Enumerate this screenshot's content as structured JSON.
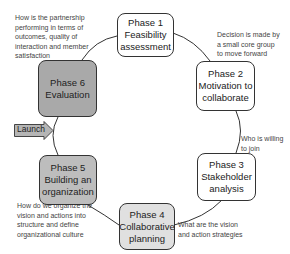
{
  "diagram": {
    "type": "cycle",
    "phases": [
      {
        "id": 1,
        "lines": [
          "Phase 1",
          "Feasibility",
          "assessment"
        ],
        "fill": "#ffffff"
      },
      {
        "id": 2,
        "lines": [
          "Phase 2",
          "Motivation to",
          "collaborate"
        ],
        "fill": "#ffffff"
      },
      {
        "id": 3,
        "lines": [
          "Phase 3",
          "Stakeholder",
          "analysis"
        ],
        "fill": "#ffffff"
      },
      {
        "id": 4,
        "lines": [
          "Phase 4",
          "Collaborative",
          "planning"
        ],
        "fill": "#e0e0e0"
      },
      {
        "id": 5,
        "lines": [
          "Phase 5",
          "Building an",
          "organization"
        ],
        "fill": "#bdbdbd"
      },
      {
        "id": 6,
        "lines": [
          "Phase 6",
          "Evaluation"
        ],
        "fill": "#a9a9a9"
      }
    ],
    "notes": {
      "phase6": [
        "How is the partnership",
        "performing in terms of",
        "outcomes, quality of",
        "interaction and member",
        "satisfaction"
      ],
      "phase1_2": [
        "Decision is made by",
        "a small core group",
        "to move forward"
      ],
      "phase2_3": [
        "Who is willing",
        "to join"
      ],
      "phase4": [
        "What are the vision",
        "and action strategies"
      ],
      "phase5": [
        "How do we organize the",
        "vision and actions into",
        "structure and define",
        "organizational culture"
      ]
    },
    "launch": {
      "label": "Launch",
      "fill": "#b5b5b5"
    }
  }
}
